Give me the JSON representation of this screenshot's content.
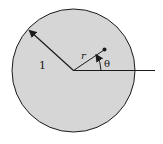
{
  "diagram": {
    "labels": {
      "radius": "1",
      "r": "r",
      "theta": "θ"
    },
    "colors": {
      "disk_fill": "#d6d6d6",
      "stroke": "#1a1a1a",
      "background": "#ffffff"
    }
  }
}
